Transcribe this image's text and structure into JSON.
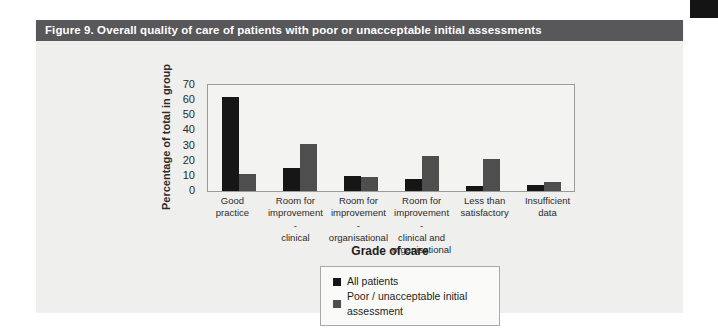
{
  "page": {
    "header_title": "Figure 9. Overall quality of care of patients with poor or unacceptable initial assessments"
  },
  "colors": {
    "header_bg": "#58585b",
    "corner_tab": "#141414",
    "panel_bg": "#efefed",
    "plot_bg": "#f3f3f1",
    "series_all_patients": "#161616",
    "series_poor_unacceptable": "#4e4e4e"
  },
  "chart_data": {
    "type": "bar",
    "title": "Figure 9. Overall quality of care of patients with poor or unacceptable initial assessments",
    "categories": [
      "Good practice",
      "Room for improvement - clinical",
      "Room for improvement - organisational",
      "Room for improvement - clinical and organisational",
      "Less than satisfactory",
      "Insufficient data"
    ],
    "category_lines": [
      [
        "Good practice"
      ],
      [
        "Room for",
        "improvement -",
        "clinical"
      ],
      [
        "Room for",
        "improvement -",
        "organisational"
      ],
      [
        "Room for",
        "improvement -",
        "clinical and",
        "organisational"
      ],
      [
        "Less than",
        "satisfactory"
      ],
      [
        "Insufficient",
        "data"
      ]
    ],
    "series": [
      {
        "name": "All patients",
        "color": "#161616",
        "values": [
          62,
          15,
          10,
          8,
          3,
          4
        ]
      },
      {
        "name": "Poor / unacceptable initial assessment",
        "color": "#4e4e4e",
        "values": [
          11,
          31,
          9,
          23,
          21,
          6
        ]
      }
    ],
    "xlabel": "Grade of care",
    "ylabel": "Percentage of total in group",
    "ylim": [
      0,
      70
    ],
    "yticks": [
      0,
      10,
      20,
      30,
      40,
      50,
      60,
      70
    ],
    "grid": false,
    "legend_position": "bottom-center"
  }
}
